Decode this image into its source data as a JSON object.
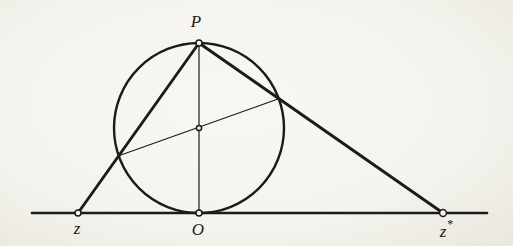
{
  "canvas": {
    "width": 513,
    "height": 246,
    "paper": "#f6f5f0",
    "ink": "#1c1b19"
  },
  "diagram": {
    "baseline": {
      "x1": 32,
      "x2": 487,
      "y": 213,
      "width": 2.6
    },
    "circle": {
      "cx": 199,
      "cy": 128,
      "r": 85,
      "width": 2.4
    },
    "points": {
      "P": {
        "x": 199,
        "y": 43
      },
      "O": {
        "x": 199,
        "y": 213
      },
      "z": {
        "x": 78,
        "y": 213
      },
      "zstar": {
        "x": 443,
        "y": 213
      },
      "center": {
        "x": 199,
        "y": 128
      },
      "q_left": {
        "x": 118.8,
        "y": 155.7
      },
      "q_right": {
        "x": 278.7,
        "y": 98.7
      }
    },
    "lines": [
      {
        "name": "segment-P-z",
        "from": "P",
        "to": "z",
        "width": 2.9
      },
      {
        "name": "segment-P-zstar",
        "from": "P",
        "to": "zstar",
        "width": 2.9
      },
      {
        "name": "segment-P-O",
        "from": "P",
        "to": "O",
        "width": 1.2
      },
      {
        "name": "chord-through-center",
        "from": "q_left",
        "to": "q_right",
        "width": 1.2
      }
    ],
    "markers": [
      {
        "at": "P",
        "r": 3.0
      },
      {
        "at": "O",
        "r": 3.0
      },
      {
        "at": "z",
        "r": 3.0
      },
      {
        "at": "zstar",
        "r": 3.4
      },
      {
        "at": "center",
        "r": 2.6
      }
    ],
    "labels": {
      "P": {
        "text": "P",
        "x": 196,
        "y": 13
      },
      "O": {
        "text": "O",
        "x": 198,
        "y": 221
      },
      "z": {
        "text": "z",
        "x": 77,
        "y": 220
      },
      "zstar": {
        "text": "z",
        "sup": "*",
        "x": 446,
        "y": 220
      }
    }
  }
}
